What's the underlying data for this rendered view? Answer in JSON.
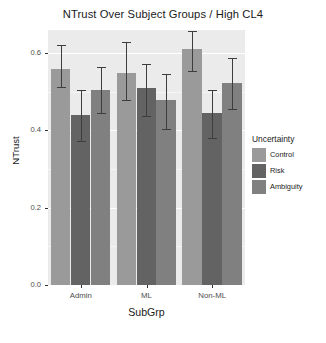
{
  "chart_data": {
    "type": "bar",
    "title": "NTrust Over Subject Groups / High CL4",
    "xlabel": "SubGrp",
    "ylabel": "NTrust",
    "categories": [
      "Admin",
      "ML",
      "Non-ML"
    ],
    "ylim": [
      0.0,
      0.66
    ],
    "yticks": [
      0.0,
      0.2,
      0.4,
      0.6
    ],
    "ytick_labels": [
      "0.0",
      "0.2",
      "0.4",
      "0.6"
    ],
    "grid": true,
    "legend": {
      "title": "Uncertainty",
      "position": "right",
      "entries": [
        "Control",
        "Risk",
        "Ambiguity"
      ]
    },
    "series": [
      {
        "name": "Control",
        "color": "#9a9a9a",
        "values": [
          0.56,
          0.549,
          0.612
        ],
        "err_low": [
          0.513,
          0.478,
          0.553
        ],
        "err_high": [
          0.62,
          0.628,
          0.657
        ]
      },
      {
        "name": "Risk",
        "color": "#636363",
        "values": [
          0.44,
          0.51,
          0.445
        ],
        "err_low": [
          0.372,
          0.438,
          0.38
        ],
        "err_high": [
          0.504,
          0.571,
          0.506
        ]
      },
      {
        "name": "Ambiguity",
        "color": "#808080",
        "values": [
          0.505,
          0.478,
          0.524
        ],
        "err_low": [
          0.445,
          0.405,
          0.455
        ],
        "err_high": [
          0.565,
          0.545,
          0.588
        ]
      }
    ]
  },
  "colors": {
    "panel_background": "#ebebeb",
    "gridline": "#ffffff",
    "error_bar": "#3d3d3d",
    "text": "#1a1a1a",
    "tick_text": "#4d4d4d"
  }
}
